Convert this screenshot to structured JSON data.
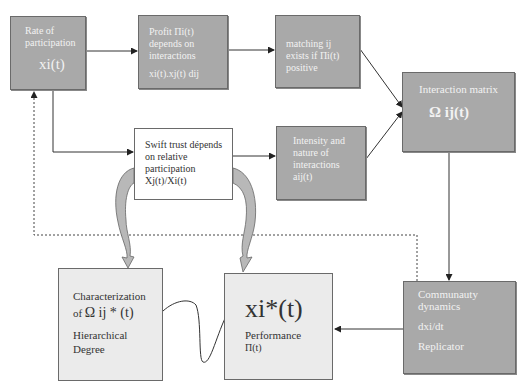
{
  "nodes": {
    "rate": {
      "line1": "Rate of",
      "line2": "participation",
      "var": "xi(t)"
    },
    "profit": {
      "line1": "Profit Πi(t)",
      "line2": "depends on",
      "line3": "interactions",
      "formula": "xi(t).xj(t) dij"
    },
    "matching": {
      "line1": "matching ij",
      "line2": "exists if Πi(t)",
      "line3": "positive"
    },
    "interaction_matrix": {
      "title": "Interaction matrix",
      "symbol": "Ω ij(t)"
    },
    "swift_trust": {
      "line1": "Swift trust dépends",
      "line2": "on relative",
      "line3": "participation",
      "formula": "Xj(t)/Xi(t)"
    },
    "intensity": {
      "line1": "Intensity and",
      "line2": "nature of",
      "line3": "interactions",
      "formula": "aij(t)"
    },
    "characterization": {
      "line1": "Characterization",
      "prefix": "of",
      "symbol": "Ω ij * (t)",
      "line3": "Hierarchical",
      "line4": "Degree"
    },
    "performance": {
      "var": "xi*(t)",
      "label": "Performance",
      "formula": "Π(t)"
    },
    "community": {
      "line1": "Communauty",
      "line2": "dynamics",
      "formula": "dxi/dt",
      "label": "Replicator"
    }
  },
  "colors": {
    "dark_box": "#a9a9a9",
    "light_box": "#ebebeb",
    "line": "#333333"
  }
}
